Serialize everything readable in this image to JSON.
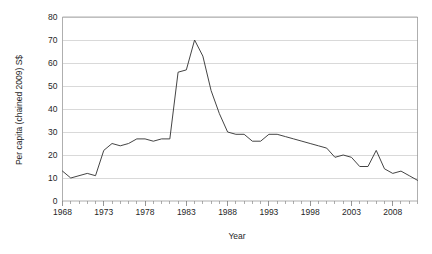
{
  "figure": {
    "cut_off_header": "",
    "background_color": "#ffffff",
    "line_color": "#3a3a3a",
    "grid_color": "#c9c9c9",
    "axis_color": "#9a9a9a"
  },
  "chart_data": {
    "type": "line",
    "title": "",
    "xlabel": "Year",
    "ylabel": "Per capita (chained 2009) S$",
    "xlim": [
      1968,
      2011
    ],
    "ylim": [
      0,
      80
    ],
    "grid": true,
    "legend": false,
    "y_ticks": [
      0,
      10,
      20,
      30,
      40,
      50,
      60,
      70,
      80
    ],
    "x_ticks": [
      1968,
      1973,
      1978,
      1983,
      1988,
      1993,
      1998,
      2003,
      2008
    ],
    "x_tick_interval_minor": 1,
    "x": [
      1968,
      1969,
      1970,
      1971,
      1972,
      1973,
      1974,
      1975,
      1976,
      1977,
      1978,
      1979,
      1980,
      1981,
      1982,
      1983,
      1984,
      1985,
      1986,
      1987,
      1988,
      1989,
      1990,
      1991,
      1992,
      1993,
      1994,
      1995,
      1996,
      1997,
      1998,
      1999,
      2000,
      2001,
      2002,
      2003,
      2004,
      2005,
      2006,
      2007,
      2008,
      2009,
      2010,
      2011
    ],
    "values": [
      13,
      10,
      11,
      12,
      11,
      22,
      25,
      24,
      25,
      27,
      27,
      26,
      27,
      27,
      56,
      57,
      70,
      63,
      48,
      38,
      30,
      29,
      29,
      26,
      26,
      29,
      29,
      28,
      27,
      26,
      25,
      24,
      23,
      19,
      20,
      19,
      15,
      15,
      22,
      14,
      12,
      13,
      11,
      9
    ],
    "series": [
      {
        "name": "Per capita (chained 2009) S$",
        "values": [
          13,
          10,
          11,
          12,
          11,
          22,
          25,
          24,
          25,
          27,
          27,
          26,
          27,
          27,
          56,
          57,
          70,
          63,
          48,
          38,
          30,
          29,
          29,
          26,
          26,
          29,
          29,
          28,
          27,
          26,
          25,
          24,
          23,
          19,
          20,
          19,
          15,
          15,
          22,
          14,
          12,
          13,
          11,
          9
        ]
      }
    ]
  }
}
